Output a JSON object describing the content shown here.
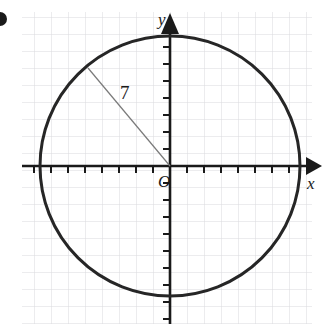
{
  "figure": {
    "width": 329,
    "height": 334,
    "background_color": "#ffffff"
  },
  "grid": {
    "line_color": "#d9d9dd",
    "cell_size": 17,
    "left": 22,
    "top": 12,
    "right": 312,
    "bottom": 324,
    "visible": true
  },
  "axes": {
    "color": "#1a1a1a",
    "origin": {
      "x": 170,
      "y": 166
    },
    "tick_spacing": 17,
    "tick_length": 7,
    "x_axis": {
      "label": "x",
      "label_x": 307,
      "label_y": 189,
      "start_x": 22,
      "end_x": 318,
      "arrow": "right"
    },
    "y_axis": {
      "label": "y",
      "label_x": 158,
      "label_y": 25,
      "start_y": 324,
      "end_y": 18,
      "arrow": "up"
    },
    "origin_label": "O",
    "origin_label_x": 158,
    "origin_label_y": 187
  },
  "circle": {
    "center_x": 170,
    "center_y": 166,
    "radius": 130,
    "stroke_color": "#262626",
    "stroke_width": 3,
    "fill": "none"
  },
  "radius_segment": {
    "label": "7",
    "label_x": 120,
    "label_y": 99,
    "from_x": 88,
    "from_y": 68,
    "to_x": 170,
    "to_y": 166,
    "stroke_color": "#7a7a7a",
    "stroke_width": 1.2
  },
  "bullet_marker": {
    "present": true,
    "x": 0,
    "y": 19,
    "radius": 7,
    "color": "#1a1a1a",
    "description": "partially cropped dark bullet at left edge"
  },
  "chart_data": {
    "type": "scatter",
    "xlabel": "x",
    "ylabel": "y",
    "grid": true,
    "legend": null,
    "annotations": [
      "7",
      "O",
      "x",
      "y"
    ],
    "shapes": [
      {
        "kind": "circle",
        "center": [
          0,
          0
        ],
        "radius": 7,
        "radius_label": "7",
        "units": "grid squares"
      },
      {
        "kind": "segment",
        "from": [
          0,
          0
        ],
        "to": [
          -4.8,
          5.75
        ],
        "label": "7",
        "description": "radius drawn from origin to the circle in the second quadrant"
      }
    ],
    "xlim": [
      -8.7,
      8.7
    ],
    "ylim": [
      -9.3,
      9.1
    ],
    "x_ticks": [
      -7,
      -6,
      -5,
      -4,
      -3,
      -2,
      -1,
      0,
      1,
      2,
      3,
      4,
      5,
      6,
      7,
      8
    ],
    "y_ticks": [
      -7,
      -6,
      -5,
      -4,
      -3,
      -2,
      -1,
      0,
      1,
      2,
      3,
      4,
      5,
      6,
      7,
      8
    ],
    "tick_labels_shown": false
  }
}
